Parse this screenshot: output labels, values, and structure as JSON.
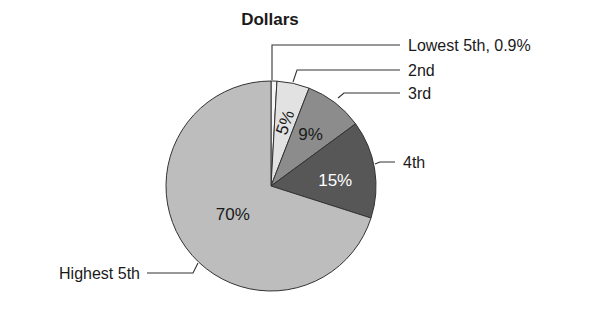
{
  "chart_data": {
    "type": "pie",
    "title": "Dollars",
    "start_angle_deg": 0,
    "direction": "clockwise",
    "slices": [
      {
        "name": "Lowest 5th",
        "value": 0.9,
        "label": "Lowest 5th, 0.9%",
        "inner_label": "",
        "color": "#f7f7f7",
        "text_color": "#1a1a1a"
      },
      {
        "name": "2nd",
        "value": 5,
        "label": "2nd",
        "inner_label": "5%",
        "color": "#e2e2e2",
        "text_color": "#1a1a1a"
      },
      {
        "name": "3rd",
        "value": 9,
        "label": "3rd",
        "inner_label": "9%",
        "color": "#8c8c8c",
        "text_color": "#1a1a1a"
      },
      {
        "name": "4th",
        "value": 15,
        "label": "4th",
        "inner_label": "15%",
        "color": "#575757",
        "text_color": "#ffffff"
      },
      {
        "name": "Highest 5th",
        "value": 70,
        "label": "Highest 5th",
        "inner_label": "70%",
        "color": "#bdbdbd",
        "text_color": "#1a1a1a"
      }
    ],
    "legend": "callout labels with leader lines"
  }
}
